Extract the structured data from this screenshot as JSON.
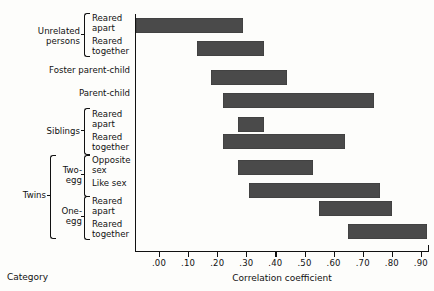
{
  "chart_data": {
    "type": "bar",
    "orientation": "horizontal-range",
    "title": "",
    "xlabel": "Correlation coefficient",
    "ylabel": "Category",
    "xlim": [
      -0.08,
      1.0
    ],
    "grid": false,
    "legend": null,
    "xticks": [
      ".00",
      ".10",
      ".20",
      ".30",
      ".40",
      ".50",
      ".60",
      ".70",
      ".80",
      ".90"
    ],
    "xtick_values": [
      0.0,
      0.1,
      0.2,
      0.3,
      0.4,
      0.5,
      0.6,
      0.7,
      0.8,
      0.9
    ],
    "categories": [
      "Unrelated persons — Reared apart",
      "Unrelated persons — Reared together",
      "Foster parent-child",
      "Parent-child",
      "Siblings — Reared apart",
      "Siblings — Reared together",
      "Twins / Two-egg — Opposite sex",
      "Twins / Two-egg — Like sex",
      "Twins / One-egg — Reared apart",
      "Twins / One-egg — Reared together"
    ],
    "ranges": [
      {
        "category": "Unrelated persons — Reared apart",
        "low": -0.08,
        "high": 0.29
      },
      {
        "category": "Unrelated persons — Reared together",
        "low": 0.13,
        "high": 0.36
      },
      {
        "category": "Foster parent-child",
        "low": 0.18,
        "high": 0.44
      },
      {
        "category": "Parent-child",
        "low": 0.22,
        "high": 0.74
      },
      {
        "category": "Siblings — Reared apart",
        "low": 0.27,
        "high": 0.36
      },
      {
        "category": "Siblings — Reared together",
        "low": 0.22,
        "high": 0.64
      },
      {
        "category": "Twins / Two-egg — Opposite sex",
        "low": 0.27,
        "high": 0.53
      },
      {
        "category": "Twins / Two-egg — Like sex",
        "low": 0.31,
        "high": 0.76
      },
      {
        "category": "Twins / One-egg — Reared apart",
        "low": 0.55,
        "high": 0.8
      },
      {
        "category": "Twins / One-egg — Reared together",
        "low": 0.65,
        "high": 0.92
      }
    ],
    "bar_color": "#4a4a4a"
  },
  "axis": {
    "x_title": "Correlation coefficient",
    "category_title": "Category",
    "ticks": [
      {
        "label": ".00"
      },
      {
        "label": ".10"
      },
      {
        "label": ".20"
      },
      {
        "label": ".30"
      },
      {
        "label": ".40"
      },
      {
        "label": ".50"
      },
      {
        "label": ".60"
      },
      {
        "label": ".70"
      },
      {
        "label": ".80"
      },
      {
        "label": ".90"
      }
    ]
  },
  "labels": {
    "unrelated_persons": "Unrelated\npersons",
    "unrelated_apart": "Reared\napart",
    "unrelated_together": "Reared\ntogether",
    "foster_parent_child": "Foster parent-child",
    "parent_child": "Parent-child",
    "siblings": "Siblings",
    "siblings_apart": "Reared\napart",
    "siblings_together": "Reared\ntogether",
    "twins": "Twins",
    "two_egg": "Two-\negg",
    "two_egg_opposite": "Opposite\nsex",
    "two_egg_like": "Like sex",
    "one_egg": "One-\negg",
    "one_egg_apart": "Reared\napart",
    "one_egg_together": "Reared\ntogether"
  }
}
